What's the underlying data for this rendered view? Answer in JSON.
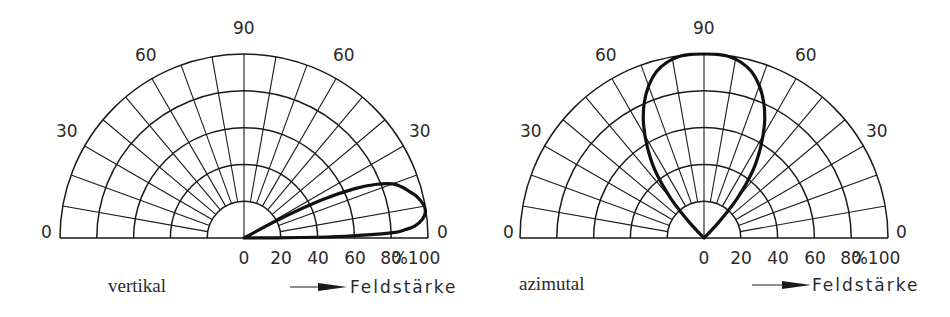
{
  "diagrams": [
    {
      "id": "vertikal",
      "caption": "vertikal",
      "angle_labels": {
        "left_0": "0",
        "left_30": "30",
        "left_60": "60",
        "top_90": "90",
        "right_60": "60",
        "right_30": "30",
        "right_0": "0"
      },
      "radial_tick_labels": [
        "0",
        "20",
        "40",
        "60",
        "80",
        "%100"
      ],
      "axis_label": "Feldstärke",
      "pattern": {
        "description": "Elevation lobe peaking near 10° with ~100% field strength",
        "points_deg_pct": [
          [
            0,
            0
          ],
          [
            0.5,
            30
          ],
          [
            1,
            55
          ],
          [
            2,
            80
          ],
          [
            3,
            88
          ],
          [
            4,
            93
          ],
          [
            6,
            97.5
          ],
          [
            8,
            99.5
          ],
          [
            10,
            99.5
          ],
          [
            12,
            98
          ],
          [
            14,
            96
          ],
          [
            16,
            93
          ],
          [
            18,
            90
          ],
          [
            20,
            86
          ],
          [
            22,
            78
          ],
          [
            24,
            66
          ],
          [
            26,
            48
          ],
          [
            28,
            22
          ],
          [
            30,
            0
          ]
        ]
      }
    },
    {
      "id": "azimutal",
      "caption": "azimutal",
      "angle_labels": {
        "left_0": "0",
        "left_30": "30",
        "left_60": "60",
        "top_90": "90",
        "right_60": "60",
        "right_30": "30",
        "right_0": "0"
      },
      "radial_tick_labels": [
        "0",
        "20",
        "40",
        "60",
        "80",
        "%100"
      ],
      "axis_label": "Feldstärke",
      "pattern": {
        "description": "Azimuth lobe symmetric about 90° with 100% at main axis",
        "points_deg_pct": [
          [
            45,
            0
          ],
          [
            47,
            12
          ],
          [
            50,
            28
          ],
          [
            54,
            45
          ],
          [
            58,
            58
          ],
          [
            62,
            70
          ],
          [
            66,
            80
          ],
          [
            70,
            88
          ],
          [
            74,
            94
          ],
          [
            78,
            97.5
          ],
          [
            82,
            99.5
          ],
          [
            86,
            100
          ],
          [
            90,
            100
          ],
          [
            94,
            100
          ],
          [
            98,
            99.5
          ],
          [
            102,
            97.5
          ],
          [
            106,
            94
          ],
          [
            110,
            88
          ],
          [
            114,
            80
          ],
          [
            118,
            70
          ],
          [
            122,
            58
          ],
          [
            126,
            45
          ],
          [
            130,
            28
          ],
          [
            133,
            12
          ],
          [
            135,
            0
          ]
        ]
      }
    }
  ],
  "grid": {
    "rings_pct": [
      20,
      40,
      60,
      80,
      100
    ],
    "radial_step_deg": 10
  },
  "colors": {
    "ink": "#1a1a1a",
    "background": "#ffffff"
  }
}
